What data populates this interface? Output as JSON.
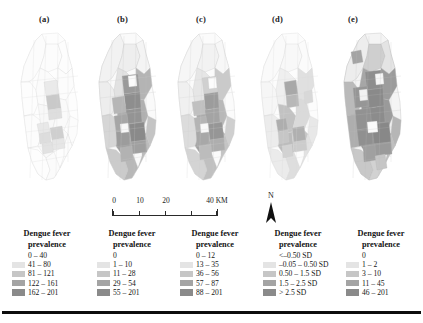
{
  "figure": {
    "panels": [
      {
        "id": "a",
        "label": "(a)"
      },
      {
        "id": "b",
        "label": "(b)"
      },
      {
        "id": "c",
        "label": "(c)"
      },
      {
        "id": "d",
        "label": "(d)"
      },
      {
        "id": "e",
        "label": "(e)"
      }
    ]
  },
  "scalebar": {
    "ticks": [
      "0",
      "10",
      "20",
      "40 KM"
    ],
    "values": [
      0,
      10,
      20,
      40
    ],
    "unit": "KM"
  },
  "north_arrow": {
    "label": "N",
    "icon": "north-arrow-icon"
  },
  "legends": [
    {
      "panel": "a",
      "title_line1": "Dengue fever",
      "title_line2": "prevalence",
      "classes": [
        {
          "label": "0 – 40",
          "color": "#ffffff"
        },
        {
          "label": "41 – 80",
          "color": "#e4e4e4"
        },
        {
          "label": "81 – 121",
          "color": "#c6c6c6"
        },
        {
          "label": "122 – 161",
          "color": "#a4a4a4"
        },
        {
          "label": "162 – 201",
          "color": "#8a8a8a"
        }
      ]
    },
    {
      "panel": "b",
      "title_line1": "Dengue fever",
      "title_line2": "prevalence",
      "classes": [
        {
          "label": "0",
          "color": "#ffffff"
        },
        {
          "label": "1 – 10",
          "color": "#e4e4e4"
        },
        {
          "label": "11 – 28",
          "color": "#c6c6c6"
        },
        {
          "label": "29 – 54",
          "color": "#a4a4a4"
        },
        {
          "label": "55 – 201",
          "color": "#8a8a8a"
        }
      ]
    },
    {
      "panel": "c",
      "title_line1": "Dengue fever",
      "title_line2": "prevalence",
      "classes": [
        {
          "label": "0 – 12",
          "color": "#ffffff"
        },
        {
          "label": "13 – 35",
          "color": "#e4e4e4"
        },
        {
          "label": "36 – 56",
          "color": "#c6c6c6"
        },
        {
          "label": "57 – 87",
          "color": "#a4a4a4"
        },
        {
          "label": "88 – 201",
          "color": "#8a8a8a"
        }
      ]
    },
    {
      "panel": "d",
      "title_line1": "Dengue fever",
      "title_line2": "prevalence",
      "classes": [
        {
          "label": "<–0.50 SD",
          "color": "#ffffff"
        },
        {
          "label": "–0.05 – 0.50 SD",
          "color": "#e4e4e4"
        },
        {
          "label": "0.50 – 1.5 SD",
          "color": "#c6c6c6"
        },
        {
          "label": "1.5 – 2.5 SD",
          "color": "#a4a4a4"
        },
        {
          "label": "> 2.5 SD",
          "color": "#8a8a8a"
        }
      ]
    },
    {
      "panel": "e",
      "title_line1": "Dengue fever",
      "title_line2": "prevalence",
      "classes": [
        {
          "label": "0",
          "color": "#ffffff"
        },
        {
          "label": "1 – 2",
          "color": "#e4e4e4"
        },
        {
          "label": "3 – 10",
          "color": "#c6c6c6"
        },
        {
          "label": "11 – 45",
          "color": "#a4a4a4"
        },
        {
          "label": "46 – 201",
          "color": "#8a8a8a"
        }
      ]
    }
  ]
}
